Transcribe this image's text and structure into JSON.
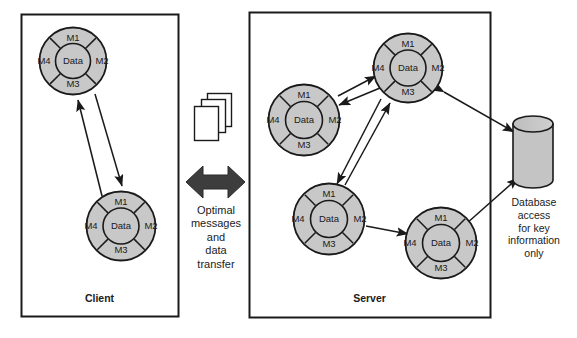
{
  "diagram": {
    "colors": {
      "object_fill": "#c8c8c8",
      "object_stroke": "#1a1a1a",
      "core_fill": "#c8c8c8",
      "arrow": "#1a1a1a",
      "big_arrow": "#3b3b3b",
      "box_stroke": "#1a1a1a",
      "page_fill": "#ffffff",
      "cylinder_fill": "#c4c4c4",
      "background": "#ffffff"
    },
    "panels": [
      {
        "id": "client",
        "label": "Client",
        "x": 21,
        "y": 14,
        "w": 157,
        "h": 302
      },
      {
        "id": "server",
        "label": "Server",
        "x": 249,
        "y": 12,
        "w": 241,
        "h": 305
      }
    ],
    "center": {
      "pages_icon_name": "stacked-pages-icon",
      "arrow_icon_name": "double-headed-arrow-icon",
      "caption_lines": [
        "Optimal",
        "messages",
        "and",
        "data",
        "transfer"
      ]
    },
    "database": {
      "icon_name": "database-cylinder-icon",
      "caption_lines": [
        "Database",
        "access",
        "for key",
        "information",
        "only"
      ]
    },
    "object_template": {
      "core_label": "Data",
      "segments": [
        "M1",
        "M2",
        "M3",
        "M4"
      ]
    },
    "objects": [
      {
        "id": "client-object-1",
        "panel": "client",
        "cx": 73,
        "cy": 61,
        "r": 34
      },
      {
        "id": "client-object-2",
        "panel": "client",
        "cx": 121,
        "cy": 226,
        "r": 35
      },
      {
        "id": "server-object-1",
        "panel": "server",
        "cx": 408,
        "cy": 68,
        "r": 35
      },
      {
        "id": "server-object-2",
        "panel": "server",
        "cx": 304,
        "cy": 120,
        "r": 36
      },
      {
        "id": "server-object-3",
        "panel": "server",
        "cx": 329,
        "cy": 219,
        "r": 36
      },
      {
        "id": "server-object-4",
        "panel": "server",
        "cx": 441,
        "cy": 243,
        "r": 36
      }
    ],
    "connections": [
      {
        "id": "client-1-to-2",
        "from": "client-object-1",
        "to": "client-object-2",
        "type": "single"
      },
      {
        "id": "client-2-to-1",
        "from": "client-object-2",
        "to": "client-object-1",
        "type": "single"
      },
      {
        "id": "server-2-to-1",
        "from": "server-object-2",
        "to": "server-object-1",
        "type": "single"
      },
      {
        "id": "server-1-to-2",
        "from": "server-object-1",
        "to": "server-object-2",
        "type": "single"
      },
      {
        "id": "server-3-to-1",
        "from": "server-object-3",
        "to": "server-object-1",
        "type": "single"
      },
      {
        "id": "server-1-to-3",
        "from": "server-object-1",
        "to": "server-object-3",
        "type": "single"
      },
      {
        "id": "server-3-to-4",
        "from": "server-object-3",
        "to": "server-object-4",
        "type": "single"
      },
      {
        "id": "server-1-to-database",
        "from": "server-object-1",
        "to": "database",
        "type": "double"
      },
      {
        "id": "server-4-to-database",
        "from": "server-object-4",
        "to": "database",
        "type": "double"
      },
      {
        "id": "client-server-transfer",
        "from": "client",
        "to": "server",
        "type": "double"
      }
    ]
  }
}
